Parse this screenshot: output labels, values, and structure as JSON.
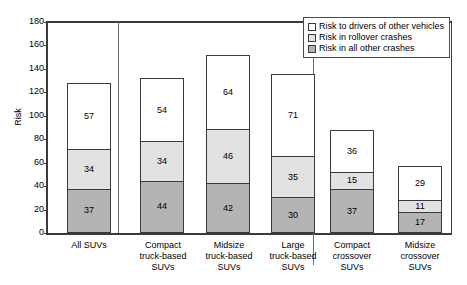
{
  "chart_data": {
    "type": "bar",
    "title": "",
    "subtitle": "",
    "xlabel": "",
    "ylabel": "Risk",
    "ylim": [
      0,
      180
    ],
    "ytick_step": 20,
    "yticks": [
      180,
      160,
      140,
      120,
      100,
      80,
      60,
      40,
      20,
      0
    ],
    "grid": false,
    "stacked": true,
    "legend_position": "top-right",
    "categories": [
      "All SUVs",
      "Compact truck-based SUVs",
      "Midsize truck-based SUVs",
      "Large truck-based SUVs",
      "Compact crossover SUVs",
      "Midsize crossover SUVs"
    ],
    "category_lines": [
      [
        "All SUVs"
      ],
      [
        "Compact",
        "truck-based",
        "SUVs"
      ],
      [
        "Midsize",
        "truck-based",
        "SUVs"
      ],
      [
        "Large",
        "truck-based",
        "SUVs"
      ],
      [
        "Compact",
        "crossover",
        "SUVs"
      ],
      [
        "Midsize",
        "crossover",
        "SUVs"
      ]
    ],
    "series": [
      {
        "name": "Risk in all other crashes",
        "color": "#b4b4b4",
        "values": [
          37,
          44,
          42,
          30,
          37,
          17
        ]
      },
      {
        "name": "Risk in rollover crashes",
        "color": "#e2e2e2",
        "values": [
          34,
          34,
          46,
          35,
          15,
          11
        ]
      },
      {
        "name": "Risk to drivers of other vehicles",
        "color": "#ffffff",
        "values": [
          57,
          54,
          64,
          71,
          36,
          29
        ]
      }
    ],
    "totals": [
      128,
      132,
      152,
      136,
      88,
      57
    ]
  },
  "legend": {
    "items": [
      {
        "label": "Risk to drivers of other vehicles",
        "color": "#ffffff"
      },
      {
        "label": "Risk in rollover crashes",
        "color": "#e2e2e2"
      },
      {
        "label": "Risk in all other crashes",
        "color": "#b4b4b4"
      }
    ]
  },
  "axis": {
    "y_title": "Risk"
  },
  "colors": {
    "axis": "#3a3a3a",
    "separator": "#6e6e6e",
    "text": "#000000",
    "background": "#ffffff"
  }
}
